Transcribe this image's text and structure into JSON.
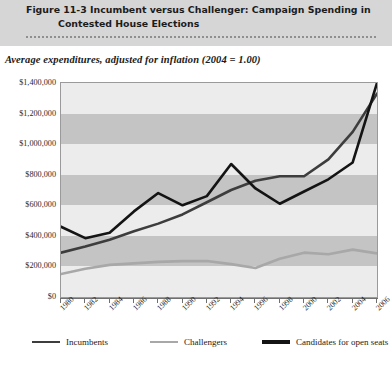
{
  "header": {
    "figure_number": "Figure 11-3",
    "title_line1": "Incumbent versus Challenger: Campaign Spending in",
    "title_line2": "Contested House Elections"
  },
  "subtitle": "Average expenditures, adjusted for inflation (2004 = 1.00)",
  "source_note": "",
  "legend": {
    "items": [
      {
        "label": "Incumbents",
        "color": "#3d3d3d"
      },
      {
        "label": "Challengers",
        "color": "#a8a8a8"
      },
      {
        "label": "Candidates for open seats",
        "color": "#141414"
      }
    ]
  },
  "colors": {
    "header_band": "#d6d6d6",
    "plot_background": "#ececec",
    "band_stripe": "#c4c4c4",
    "axis": "#6f6f6f",
    "incumbents": "#3d3d3d",
    "challengers": "#a8a8a8",
    "open_seats": "#141414"
  },
  "chart_data": {
    "type": "line",
    "title": "Incumbent versus Challenger: Campaign Spending in Contested House Elections",
    "subtitle": "Average expenditures, adjusted for inflation (2004 = 1.00)",
    "xlabel": "",
    "ylabel": "",
    "x": [
      1980,
      1982,
      1984,
      1986,
      1988,
      1990,
      1992,
      1994,
      1996,
      1998,
      2000,
      2002,
      2004,
      2006
    ],
    "xlim": [
      1980,
      2006
    ],
    "ylim": [
      0,
      1400000
    ],
    "yticks": [
      0,
      200000,
      400000,
      600000,
      800000,
      1000000,
      1200000,
      1400000
    ],
    "ytick_labels": [
      "$0",
      "$200,000",
      "$400,000",
      "$600,000",
      "$800,000",
      "$1,000,000",
      "$1,200,000",
      "$1,400,000"
    ],
    "xtick_labels": [
      "1980",
      "1982",
      "1984",
      "1986",
      "1988",
      "1990",
      "1992",
      "1994",
      "1996",
      "1998",
      "2000",
      "2002",
      "2004",
      "2006"
    ],
    "grid": "horizontal-bands",
    "legend_position": "bottom",
    "series": [
      {
        "name": "Incumbents",
        "color": "#3d3d3d",
        "values": [
          290000,
          330000,
          375000,
          430000,
          480000,
          540000,
          620000,
          700000,
          760000,
          790000,
          790000,
          900000,
          1080000,
          1330000
        ]
      },
      {
        "name": "Challengers",
        "color": "#a8a8a8",
        "values": [
          150000,
          185000,
          210000,
          220000,
          230000,
          235000,
          235000,
          215000,
          190000,
          250000,
          290000,
          280000,
          310000,
          285000
        ]
      },
      {
        "name": "Candidates for open seats",
        "color": "#141414",
        "values": [
          460000,
          385000,
          420000,
          560000,
          680000,
          600000,
          660000,
          870000,
          710000,
          610000,
          690000,
          770000,
          880000,
          1400000
        ]
      }
    ],
    "series_extra_note": "Challengers final point rises to about $420,000 at 2006"
  }
}
